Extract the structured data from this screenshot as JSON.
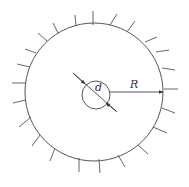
{
  "diagram": {
    "labels": {
      "diameter": "d",
      "radius": "R"
    },
    "colors": {
      "stroke": "#555555",
      "background": "#ffffff"
    },
    "outer_circle": {
      "cx": 94,
      "cy": 92,
      "r": 69
    },
    "inner_circle": {
      "cx": 96,
      "cy": 95,
      "r": 14
    },
    "hatch_count": 23
  }
}
